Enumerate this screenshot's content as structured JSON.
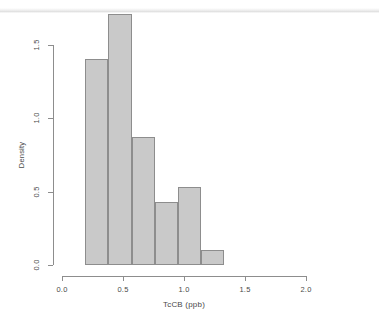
{
  "chart_data": {
    "type": "bar",
    "title": "",
    "subtitle": "",
    "xlabel": "TcCB (ppb)",
    "ylabel": "Density",
    "xlim": [
      0.0,
      2.0
    ],
    "ylim": [
      0.0,
      1.72
    ],
    "grid": false,
    "legend": null,
    "bin_width": 0.19,
    "bin_edges": [
      0.19,
      0.38,
      0.57,
      0.76,
      0.95,
      1.14,
      1.33
    ],
    "categories": [
      "0.19-0.38",
      "0.38-0.57",
      "0.57-0.76",
      "0.76-0.95",
      "0.95-1.14",
      "1.14-1.33"
    ],
    "values": [
      1.4,
      1.71,
      0.87,
      0.43,
      0.53,
      0.1
    ],
    "bar_fill_color": "#c9c9c9",
    "bar_border_color": "#8d8d8d",
    "xticks": [
      {
        "value": 0.0,
        "label": "0.0"
      },
      {
        "value": 0.5,
        "label": "0.5"
      },
      {
        "value": 1.0,
        "label": "1.0"
      },
      {
        "value": 1.5,
        "label": "1.5"
      },
      {
        "value": 2.0,
        "label": "2.0"
      }
    ],
    "yticks": [
      {
        "value": 0.0,
        "label": "0.0"
      },
      {
        "value": 0.5,
        "label": "0.5"
      },
      {
        "value": 1.0,
        "label": "1.0"
      },
      {
        "value": 1.5,
        "label": "1.5"
      }
    ]
  },
  "colors": {
    "background": "#ffffff",
    "axis": "#8d8d8d",
    "text": "#4a4a4a",
    "bar_fill": "#c9c9c9",
    "bar_border": "#8d8d8d"
  }
}
